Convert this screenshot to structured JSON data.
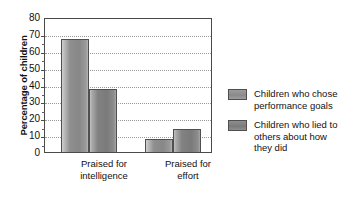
{
  "chart_data": {
    "type": "bar",
    "title": "",
    "xlabel": "",
    "ylabel": "Percentage of children",
    "ylim": [
      0,
      80
    ],
    "yticks": [
      0,
      10,
      20,
      30,
      40,
      50,
      60,
      70,
      80
    ],
    "ytick_labels": [
      "0",
      "10",
      "20",
      "30",
      "40",
      "50",
      "60",
      "70",
      "80"
    ],
    "grid": true,
    "grid_style": "dotted-horizontal",
    "legend_position": "right",
    "categories": [
      "Praised for intelligence",
      "Praised for effort"
    ],
    "category_lines": [
      [
        "Praised for",
        "intelligence"
      ],
      [
        "Praised for",
        "effort"
      ]
    ],
    "series": [
      {
        "name": "Children who chose performance goals",
        "name_lines": [
          "Children who chose",
          "performance goals"
        ],
        "color": "#8f8f8f",
        "values": [
          68,
          8
        ]
      },
      {
        "name": "Children who lied to others about how they did",
        "name_lines": [
          "Children who lied to",
          "others about how",
          "they did"
        ],
        "color": "#7d7d7d",
        "values": [
          38,
          14
        ]
      }
    ]
  },
  "axes": {
    "frame_color": "#4a4a4a",
    "gridline_color": "#9a9a9a"
  }
}
